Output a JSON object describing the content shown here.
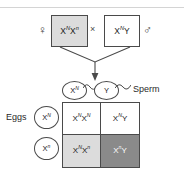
{
  "diagram": {
    "colors": {
      "carrier_fill": "#dcdcdc",
      "affected_fill": "#8a8a8a",
      "normal_fill": "#ffffff",
      "line": "#4a4a4a",
      "text": "#1a1a1a",
      "affected_text": "#ffffff"
    }
  },
  "parents": {
    "female": {
      "symbol": "♀",
      "allele1": "X",
      "sup1": "N",
      "allele2": "X",
      "sup2": "n"
    },
    "cross_symbol": "×",
    "male": {
      "symbol": "♂",
      "allele1": "X",
      "sup1": "N",
      "allele2": "Y",
      "sup2": ""
    }
  },
  "gametes": {
    "sperm_label": "Sperm",
    "eggs_label": "Eggs",
    "sperm": [
      {
        "allele": "X",
        "sup": "N"
      },
      {
        "allele": "Y",
        "sup": ""
      }
    ],
    "eggs": [
      {
        "allele": "X",
        "sup": "N"
      },
      {
        "allele": "X",
        "sup": "n"
      }
    ]
  },
  "punnett_cells": [
    {
      "a1": "X",
      "s1": "N",
      "a2": "X",
      "s2": "N",
      "fill": "#ffffff",
      "text_color": "#1a1a1a",
      "phenotype": "normal-female"
    },
    {
      "a1": "X",
      "s1": "N",
      "a2": "Y",
      "s2": "",
      "fill": "#ffffff",
      "text_color": "#1a1a1a",
      "phenotype": "normal-male"
    },
    {
      "a1": "X",
      "s1": "N",
      "a2": "X",
      "s2": "n",
      "fill": "#dcdcdc",
      "text_color": "#1a1a1a",
      "phenotype": "carrier-female"
    },
    {
      "a1": "X",
      "s1": "n",
      "a2": "Y",
      "s2": "",
      "fill": "#8a8a8a",
      "text_color": "#ffffff",
      "phenotype": "affected-male"
    }
  ]
}
